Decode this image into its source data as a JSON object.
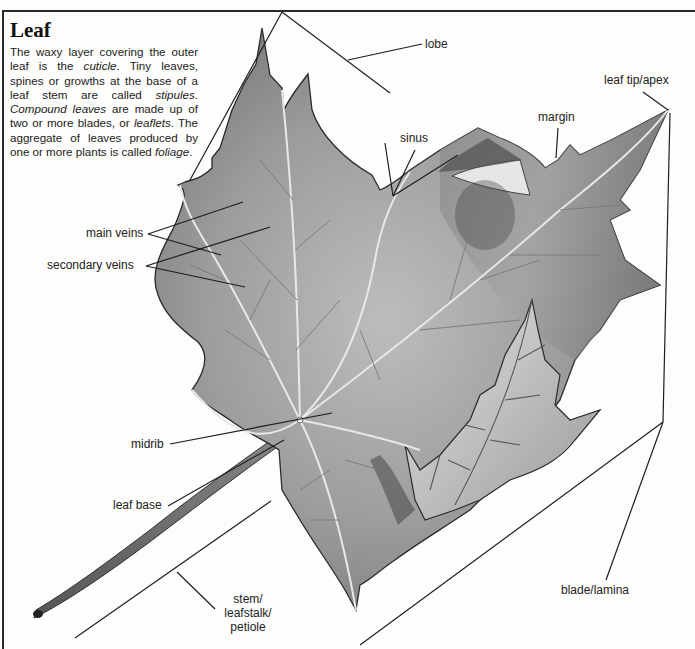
{
  "title": "Leaf",
  "intro": {
    "p1": "The waxy layer covering the outer leaf is the ",
    "t_cuticle": "cuticle",
    "p2": ". Tiny leaves, spines or growths at the base of a leaf stem are called ",
    "t_stipules": "stipules",
    "p3": ". ",
    "t_compound": "Compound leaves",
    "p4": " are made up of two or more blades, or ",
    "t_leaflets": "leaflets",
    "p5": ". The aggregate of leaves produced by one or more plants is called ",
    "t_foliage": "foliage",
    "p6": "."
  },
  "labels": {
    "lobe": "lobe",
    "leaf_tip": "leaf tip/apex",
    "margin": "margin",
    "sinus": "sinus",
    "main_veins": "main veins",
    "secondary_veins": "secondary veins",
    "midrib": "midrib",
    "leaf_base": "leaf base",
    "stem_l1": "stem/",
    "stem_l2": "leafstalk/",
    "stem_l3": "petiole",
    "blade": "blade/lamina"
  },
  "colors": {
    "ink": "#1e1e1e",
    "paper": "#fdfdfb",
    "leaf_mid": "#9a9a9a",
    "leaf_dark": "#5a5a5a",
    "leaf_light": "#d4d4d4"
  }
}
